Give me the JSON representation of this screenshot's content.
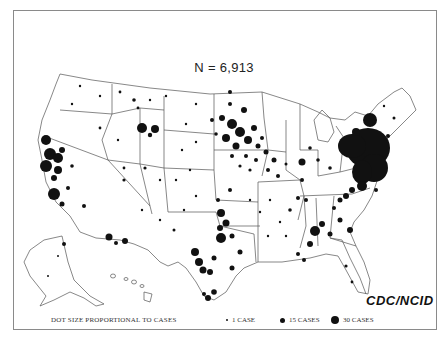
{
  "map": {
    "title": "N = 6,913",
    "credit": "CDC/NCID",
    "region": "United States (incl. Alaska and Hawaii insets)",
    "colors": {
      "dot": "#111111",
      "border": "#555555",
      "frame": "#8a8a8a"
    },
    "legend": {
      "caption": "DOT SIZE PROPORTIONAL TO CASES",
      "items": [
        {
          "label": "1 CASE",
          "cases": 1,
          "size": 2
        },
        {
          "label": "15 CASES",
          "cases": 15,
          "size": 5
        },
        {
          "label": "30 CASES",
          "cases": 30,
          "size": 8
        }
      ]
    },
    "clusters": [
      {
        "name": "Northeast (NY/NJ/PA/CT/MA)",
        "density": "very high"
      },
      {
        "name": "Upper Midwest (MN/SD/IA/WI)",
        "density": "high"
      },
      {
        "name": "California coast",
        "density": "high"
      },
      {
        "name": "Oklahoma / Texas",
        "density": "high"
      },
      {
        "name": "Southeast (GA/SC/NC)",
        "density": "high"
      },
      {
        "name": "Wyoming",
        "density": "moderate"
      }
    ]
  }
}
